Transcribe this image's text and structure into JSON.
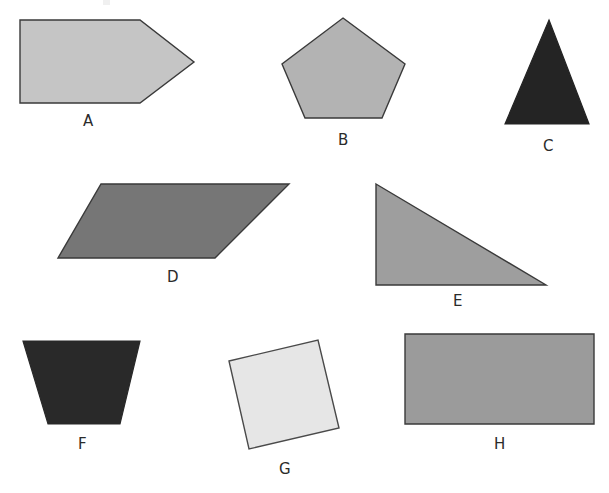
{
  "page": {
    "background_color": "#ffffff",
    "width": 609,
    "height": 493,
    "outline_color": "#3a3a3a",
    "label_color": "#2b2b2b"
  },
  "shapes": [
    {
      "id": "shape-a",
      "label": "A",
      "kind": "pentagon-arrow",
      "shape_name": "pentagon",
      "fill": "#c5c5c5",
      "stroke": "#3a3a3a",
      "stroke_width": 1.4,
      "points": "20,20 140,20 194,62 140,103 20,103",
      "label_x": 83,
      "label_y": 114
    },
    {
      "id": "shape-b",
      "label": "B",
      "kind": "regular-pentagon",
      "shape_name": "pentagon",
      "fill": "#b3b3b3",
      "stroke": "#3a3a3a",
      "stroke_width": 1.4,
      "points": "343,18 405,64 382,118 305,118 282,64",
      "label_x": 338,
      "label_y": 133
    },
    {
      "id": "shape-c",
      "label": "C",
      "kind": "isosceles-triangle",
      "shape_name": "triangle",
      "fill": "#242424",
      "stroke": "#242424",
      "stroke_width": 1.2,
      "points": "549,20 589,124 505,124",
      "label_x": 543,
      "label_y": 139
    },
    {
      "id": "shape-d",
      "label": "D",
      "kind": "parallelogram",
      "shape_name": "parallelogram",
      "fill": "#767676",
      "stroke": "#3a3a3a",
      "stroke_width": 1.4,
      "points": "101,184 289,184 215,258 58,258",
      "label_x": 167,
      "label_y": 270
    },
    {
      "id": "shape-e",
      "label": "E",
      "kind": "right-triangle",
      "shape_name": "triangle",
      "fill": "#9e9e9e",
      "stroke": "#3a3a3a",
      "stroke_width": 1.4,
      "points": "376,184 546,285 376,285",
      "label_x": 453,
      "label_y": 294
    },
    {
      "id": "shape-f",
      "label": "F",
      "kind": "trapezoid",
      "shape_name": "trapezoid",
      "fill": "#292929",
      "stroke": "#292929",
      "stroke_width": 1.2,
      "points": "23,341 140,341 120,424 48,424",
      "label_x": 78,
      "label_y": 437
    },
    {
      "id": "shape-g",
      "label": "G",
      "kind": "rotated-square",
      "shape_name": "square",
      "fill": "#e6e6e6",
      "stroke": "#4a4a4a",
      "stroke_width": 1.4,
      "points": "229,361 318,340 339,428 249,449",
      "label_x": 279,
      "label_y": 462
    },
    {
      "id": "shape-h",
      "label": "H",
      "kind": "rectangle",
      "shape_name": "rectangle",
      "fill": "#9b9b9b",
      "stroke": "#3a3a3a",
      "stroke_width": 1.4,
      "points": "405,334 594,334 594,424 405,424",
      "label_x": 494,
      "label_y": 437
    }
  ]
}
